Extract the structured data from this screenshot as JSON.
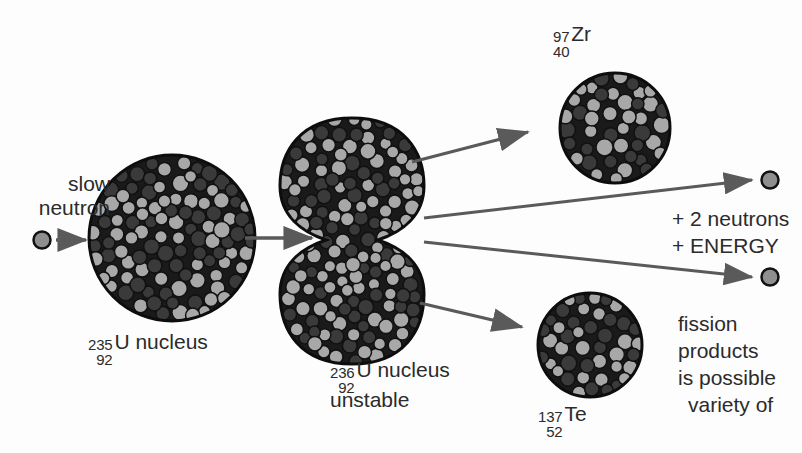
{
  "figure": {
    "background_color": "#fdfdfd",
    "ink_color": "#2b2b2b",
    "nucleon_light_color": "#a8a8a8",
    "nucleon_dark_color": "#3a3a3a",
    "nucleon_outline_color": "#111111",
    "arrow_color": "#5a5a5a"
  },
  "incoming": {
    "line1": "slow",
    "line2": "neutron",
    "particle_name": "neutron-particle"
  },
  "target_nucleus": {
    "mass_number": "235",
    "atomic_number": "92",
    "symbol": "U nucleus"
  },
  "compound_nucleus": {
    "mass_number": "236",
    "atomic_number": "92",
    "symbol": "U nucleus",
    "state": "unstable"
  },
  "products": [
    {
      "id": "zirconium-97",
      "mass_number": "97",
      "atomic_number": "40",
      "symbol": "Zr"
    },
    {
      "id": "tellurium-137",
      "mass_number": "137",
      "atomic_number": "52",
      "symbol": "Te"
    }
  ],
  "emissions": {
    "neutrons_line": "+ 2 neutrons",
    "energy_line": "+ ENERGY",
    "free_neutron_count": 2
  },
  "note": {
    "line1": "fission",
    "line2": "products",
    "line3": "is possible",
    "line4": "variety of"
  }
}
